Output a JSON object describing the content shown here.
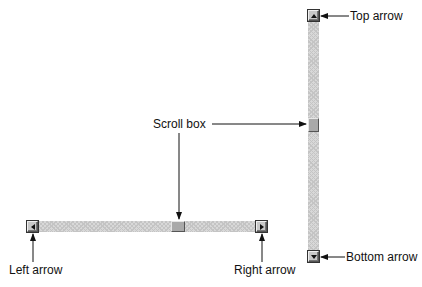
{
  "labels": {
    "top_arrow": "Top arrow",
    "bottom_arrow": "Bottom arrow",
    "scroll_box": "Scroll box",
    "left_arrow": "Left arrow",
    "right_arrow": "Right arrow"
  },
  "vertical_scrollbar": {
    "orientation": "vertical",
    "icons": {
      "up": "triangle-up-icon",
      "down": "triangle-down-icon"
    }
  },
  "horizontal_scrollbar": {
    "orientation": "horizontal",
    "icons": {
      "left": "triangle-left-icon",
      "right": "triangle-right-icon"
    }
  },
  "colors": {
    "track": "#d8d8d8",
    "button": "#c8c8c8",
    "thumb": "#a9a9a9",
    "text": "#111111"
  }
}
